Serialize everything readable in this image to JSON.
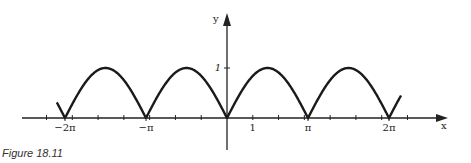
{
  "caption": "Figure 18.11",
  "chart_data": {
    "type": "line",
    "function": "y = |sin x|",
    "title": "",
    "xlabel": "x",
    "ylabel": "y",
    "x_tick_labels": [
      {
        "value": -6.2832,
        "label": "−2π"
      },
      {
        "value": -3.1416,
        "label": "−π"
      },
      {
        "value": 1,
        "label": "1"
      },
      {
        "value": 3.1416,
        "label": "π"
      },
      {
        "value": 6.2832,
        "label": "2π"
      }
    ],
    "y_tick_labels": [
      {
        "value": 1,
        "label": "1"
      }
    ],
    "minor_tick_step": 1,
    "xlim": [
      -6.6,
      6.6
    ],
    "ylim": [
      0,
      1
    ],
    "curve_domain": [
      -6.6,
      6.75
    ],
    "series": [
      {
        "name": "|sin x|",
        "x": [
          -6.2832,
          -4.7124,
          -3.1416,
          -1.5708,
          0,
          1.5708,
          3.1416,
          4.7124,
          6.2832
        ],
        "values": [
          0,
          1,
          0,
          1,
          0,
          1,
          0,
          1,
          0
        ]
      }
    ],
    "grid": false,
    "legend": null
  },
  "colors": {
    "curve": "#1a1a1a",
    "axis": "#222222"
  }
}
